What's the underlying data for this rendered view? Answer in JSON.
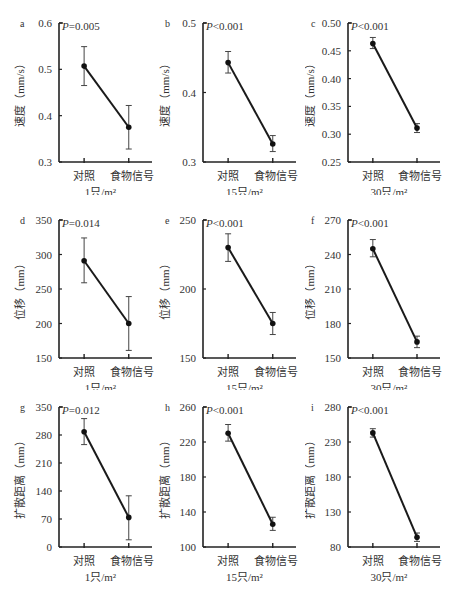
{
  "figure": {
    "x_categories": [
      "对照",
      "食物信号"
    ],
    "density_labels": [
      "1只/m²",
      "15只/m²",
      "30只/m²"
    ]
  },
  "chart_data": [
    {
      "panel": "a",
      "type": "line",
      "title": "",
      "annotation": "P=0.005",
      "xlabel": "1只/m²",
      "ylabel": "速度（mm/s）",
      "categories": [
        "对照",
        "食物信号"
      ],
      "values": [
        0.507,
        0.375
      ],
      "err_low": [
        0.465,
        0.328
      ],
      "err_high": [
        0.549,
        0.422
      ],
      "ylim": [
        0.3,
        0.6
      ],
      "yticks": [
        0.3,
        0.4,
        0.5,
        0.6
      ],
      "ytick_labels": [
        "0.3",
        "0.4",
        "0.5",
        "0.6"
      ],
      "grid": false
    },
    {
      "panel": "b",
      "type": "line",
      "title": "",
      "annotation": "P<0.001",
      "xlabel": "15只/m²",
      "ylabel": "速度（mm/s）",
      "categories": [
        "对照",
        "食物信号"
      ],
      "values": [
        0.443,
        0.326
      ],
      "err_low": [
        0.428,
        0.315
      ],
      "err_high": [
        0.459,
        0.338
      ],
      "ylim": [
        0.3,
        0.5
      ],
      "yticks": [
        0.3,
        0.4,
        0.5
      ],
      "ytick_labels": [
        "0.3",
        "0.4",
        "0.5"
      ],
      "grid": false
    },
    {
      "panel": "c",
      "type": "line",
      "title": "",
      "annotation": "P<0.001",
      "xlabel": "30只/m²",
      "ylabel": "速度（mm/s）",
      "categories": [
        "对照",
        "食物信号"
      ],
      "values": [
        0.463,
        0.311
      ],
      "err_low": [
        0.454,
        0.303
      ],
      "err_high": [
        0.474,
        0.319
      ],
      "ylim": [
        0.25,
        0.5
      ],
      "yticks": [
        0.25,
        0.3,
        0.35,
        0.4,
        0.45,
        0.5
      ],
      "ytick_labels": [
        "0.25",
        "0.30",
        "0.35",
        "0.40",
        "0.45",
        "0.50"
      ],
      "grid": false
    },
    {
      "panel": "d",
      "type": "line",
      "title": "",
      "annotation": "P=0.014",
      "xlabel": "1只/m²",
      "ylabel": "位移（mm）",
      "categories": [
        "对照",
        "食物信号"
      ],
      "values": [
        291,
        200
      ],
      "err_low": [
        259,
        161
      ],
      "err_high": [
        324,
        239
      ],
      "ylim": [
        150,
        350
      ],
      "yticks": [
        150,
        200,
        250,
        300,
        350
      ],
      "ytick_labels": [
        "150",
        "200",
        "250",
        "300",
        "350"
      ],
      "grid": false
    },
    {
      "panel": "e",
      "type": "line",
      "title": "",
      "annotation": "P<0.001",
      "xlabel": "15只/m²",
      "ylabel": "位移（mm）",
      "categories": [
        "对照",
        "食物信号"
      ],
      "values": [
        230,
        175
      ],
      "err_low": [
        220,
        167
      ],
      "err_high": [
        240,
        183
      ],
      "ylim": [
        150,
        250
      ],
      "yticks": [
        150,
        200,
        250
      ],
      "ytick_labels": [
        "150",
        "200",
        "250"
      ],
      "grid": false
    },
    {
      "panel": "f",
      "type": "line",
      "title": "",
      "annotation": "P<0.001",
      "xlabel": "30只/m²",
      "ylabel": "位移（mm）",
      "categories": [
        "对照",
        "食物信号"
      ],
      "values": [
        245,
        164
      ],
      "err_low": [
        238,
        159
      ],
      "err_high": [
        253,
        169
      ],
      "ylim": [
        150,
        270
      ],
      "yticks": [
        150,
        180,
        210,
        240,
        270
      ],
      "ytick_labels": [
        "150",
        "180",
        "210",
        "240",
        "270"
      ],
      "grid": false
    },
    {
      "panel": "g",
      "type": "line",
      "title": "",
      "annotation": "P=0.012",
      "xlabel": "1只/m²",
      "ylabel": "扩散距离（mm）",
      "categories": [
        "对照",
        "食物信号"
      ],
      "values": [
        288,
        74
      ],
      "err_low": [
        256,
        18
      ],
      "err_high": [
        321,
        128
      ],
      "ylim": [
        0,
        350
      ],
      "yticks": [
        0,
        70,
        140,
        210,
        280,
        350
      ],
      "ytick_labels": [
        "0",
        "70",
        "140",
        "210",
        "280",
        "350"
      ],
      "grid": false
    },
    {
      "panel": "h",
      "type": "line",
      "title": "",
      "annotation": "P<0.001",
      "xlabel": "15只/m²",
      "ylabel": "扩散距离（mm）",
      "categories": [
        "对照",
        "食物信号"
      ],
      "values": [
        230,
        126
      ],
      "err_low": [
        221,
        119
      ],
      "err_high": [
        240,
        134
      ],
      "ylim": [
        100,
        260
      ],
      "yticks": [
        100,
        140,
        180,
        220,
        260
      ],
      "ytick_labels": [
        "100",
        "140",
        "180",
        "220",
        "260"
      ],
      "grid": false
    },
    {
      "panel": "i",
      "type": "line",
      "title": "",
      "annotation": "P<0.001",
      "xlabel": "30只/m²",
      "ylabel": "扩散距离（mm）",
      "categories": [
        "对照",
        "食物信号"
      ],
      "values": [
        243,
        94
      ],
      "err_low": [
        237,
        88
      ],
      "err_high": [
        249,
        100
      ],
      "ylim": [
        80,
        280
      ],
      "yticks": [
        80,
        130,
        180,
        230,
        280
      ],
      "ytick_labels": [
        "80",
        "130",
        "180",
        "230",
        "280"
      ],
      "grid": false
    }
  ]
}
